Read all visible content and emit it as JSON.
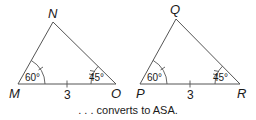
{
  "figure": {
    "triangles": [
      {
        "name": "MNO",
        "vertices": {
          "left": "M",
          "top": "N",
          "right": "O"
        },
        "angle_left": "60°",
        "angle_right": "45°",
        "base_length": "3"
      },
      {
        "name": "PQR",
        "vertices": {
          "left": "P",
          "top": "Q",
          "right": "R"
        },
        "angle_left": "60°",
        "angle_right": "45°",
        "base_length": "3"
      }
    ],
    "caption": ". . . converts to ASA."
  },
  "colors": {
    "stroke": "#555555",
    "text": "#1a1a1a",
    "background": "#ffffff"
  }
}
